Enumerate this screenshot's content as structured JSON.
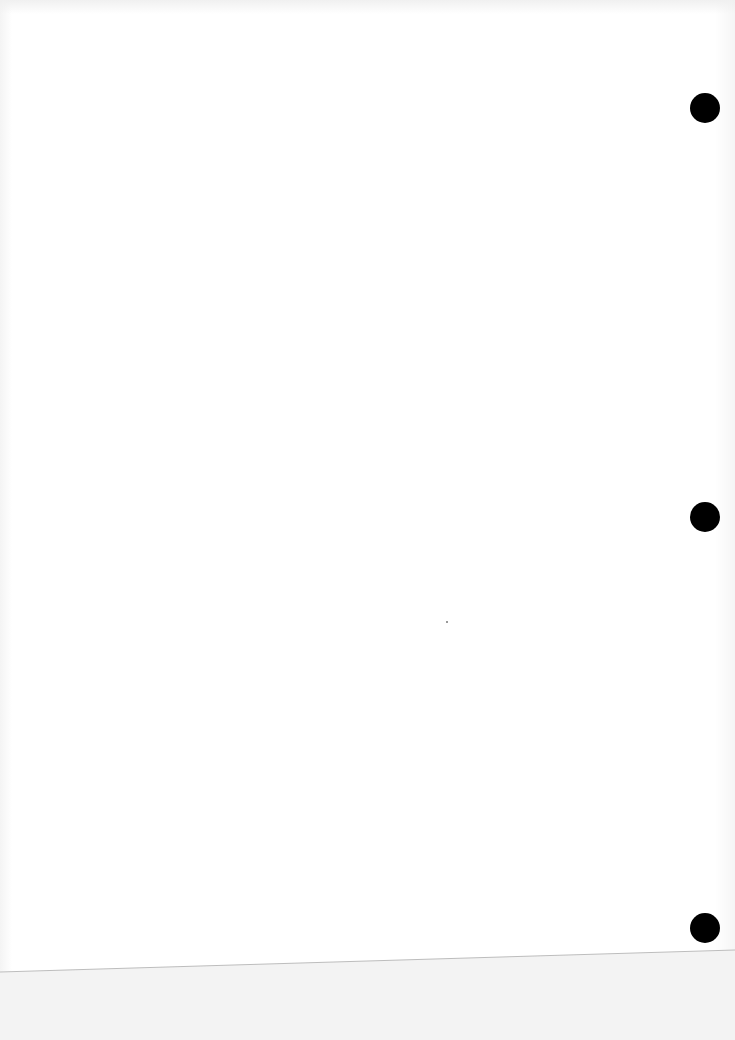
{
  "document": {
    "type": "scanned blank page",
    "text_content": "",
    "colors": {
      "paper": "#ffffff",
      "punch_hole": "#000000",
      "background_below_edge": "#f3f3f3",
      "edge_line": "#bdbdbd"
    },
    "punch_holes": [
      {
        "cx": 705,
        "cy": 108,
        "r": 15
      },
      {
        "cx": 705,
        "cy": 517,
        "r": 15
      },
      {
        "cx": 705,
        "cy": 928,
        "r": 15
      }
    ],
    "paper_edge_line": {
      "x1": 0,
      "y1": 972,
      "x2": 735,
      "y2": 950
    }
  }
}
